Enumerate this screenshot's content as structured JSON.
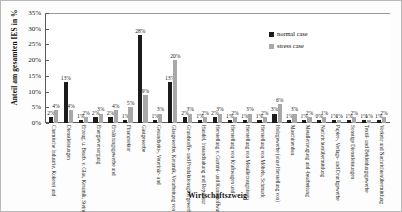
{
  "chart_data": {
    "type": "bar",
    "title": "",
    "xlabel": "Wirtschaftszweig",
    "ylabel": "Anteil am gesamten IES in %",
    "ylim": [
      0,
      35
    ],
    "ytick_labels": [
      "0%",
      "5%",
      "10%",
      "15%",
      "20%",
      "25%",
      "30%",
      "35%"
    ],
    "ytick_values": [
      0,
      5,
      10,
      15,
      20,
      25,
      30,
      35
    ],
    "grid": false,
    "legend_position": "top-right",
    "categories": [
      "Chemische Industrie, Kokerei und",
      "Dienstleistungen",
      "Erzeug. u. Bearb. v. Glas, Keramik, Steine",
      "Energieversorgung",
      "Ernährungsgewerbe und",
      "Finanzsektor",
      "Gastgewerbe",
      "Gesundheits-, Veterinär- und",
      "Glasgewerbe, Keramik, Verarbeitung von",
      "Grundstoffe- und Produktionsgütergewerbe",
      "Handel, Instandhaltung und Reparatur",
      "Herstellung v. Gummi- und Kunststoffwaren",
      "Herstellung von Kraftwagen und",
      "Herstellung von Metallerzeugnissen",
      "Herstellung von Möbeln, Schmuck",
      "Holzgewerbe (ohne Herstellung von)",
      "Maschinenbau",
      "Metallerzeugung und -bearbeitung",
      "Nachrichtenübermittlung",
      "Papier-, Verlags- und Druckgewerbe",
      "Sonstige Dienstleistungen",
      "Textil- und Bekleidungsgewerbe",
      "Verkehr und Nachrichtenübermittlung"
    ],
    "series": [
      {
        "name": "normal case",
        "color": "#1c1c1c",
        "values": [
          2,
          13,
          1,
          2,
          2,
          1,
          28,
          1,
          13,
          2,
          1,
          2,
          1,
          1,
          1,
          3,
          1,
          1,
          1,
          1,
          1,
          1,
          1
        ],
        "labels": [
          "2%",
          "13%",
          "1%",
          "2%",
          "2%",
          "1%",
          "28%",
          "1%",
          "13%",
          "2%",
          "1%",
          "2%",
          "1%",
          "1%",
          "1%",
          "3%",
          "1%",
          "1%",
          "0%",
          "1%",
          "1%",
          "1%",
          "1%"
        ]
      },
      {
        "name": "stress case",
        "color": "#a8a8a8",
        "values": [
          4,
          4,
          2,
          3,
          4,
          5,
          9,
          3,
          20,
          3,
          2,
          3,
          2,
          3,
          2,
          6,
          3,
          2,
          2,
          1,
          2,
          1,
          2
        ],
        "labels": [
          "4%",
          "4%",
          "2%",
          "3%",
          "4%",
          "5%",
          "9%",
          "3%",
          "20%",
          "3%",
          "2%",
          "3%",
          "2%",
          "3%",
          "2%",
          "6%",
          "3%",
          "2%",
          "1%",
          "1%",
          "2%",
          "1%",
          "2%"
        ]
      }
    ]
  },
  "legend": {
    "items": [
      {
        "label": "normal case",
        "key": "normal"
      },
      {
        "label": "stress case",
        "key": "stress"
      }
    ]
  }
}
